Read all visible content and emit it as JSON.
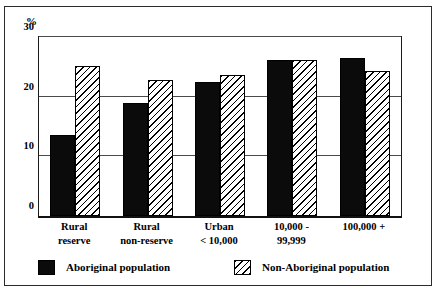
{
  "chart_data": {
    "type": "bar",
    "title": "",
    "subtitle": "",
    "xlabel": "",
    "ylabel": "%",
    "ylim": [
      0,
      30
    ],
    "yticks": [
      0,
      10,
      20,
      30
    ],
    "ytick_labels": [
      "0",
      "10",
      "20",
      "30"
    ],
    "grid": true,
    "legend_position": "bottom",
    "categories": [
      "Rural reserve",
      "Rural non-reserve",
      "Urban < 10,000",
      "10,000 - 99,999",
      "100,000 +"
    ],
    "category_lines": [
      [
        "Rural",
        "reserve"
      ],
      [
        "Rural",
        "non-reserve"
      ],
      [
        "Urban",
        "< 10,000"
      ],
      [
        "10,000 -",
        "99,999"
      ],
      [
        "100,000 +",
        ""
      ]
    ],
    "series": [
      {
        "name": "Aboriginal population",
        "pattern": "solid-black",
        "values": [
          13.5,
          19.0,
          22.5,
          26.2,
          26.4
        ]
      },
      {
        "name": "Non-Aboriginal population",
        "pattern": "diagonal-hatch",
        "values": [
          25.2,
          22.8,
          23.6,
          26.2,
          24.3
        ]
      }
    ]
  },
  "axis": {
    "unit_label": "%"
  },
  "legend": {
    "entries": [
      {
        "label": "Aboriginal population",
        "swatch": "solid-black-swatch"
      },
      {
        "label": "Non-Aboriginal population",
        "swatch": "hatched-swatch"
      }
    ]
  },
  "colors": {
    "series_1": "#0b0b0b",
    "series_2_outline": "#000000",
    "frame": "#2b2b2b",
    "gridline": "#4a4a4a",
    "background": "#ffffff"
  }
}
